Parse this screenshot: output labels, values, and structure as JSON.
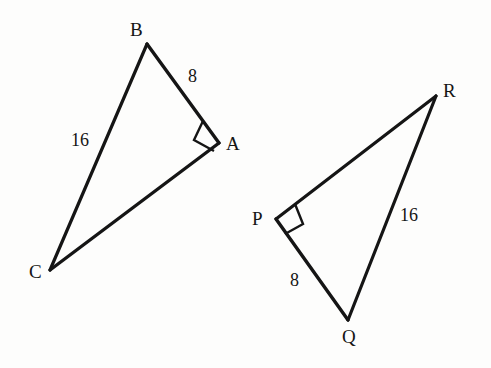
{
  "figure": {
    "background_color": "#fdfdfc",
    "stroke_color": "#151515",
    "stroke_width": 3
  },
  "triangles": [
    {
      "name": "triangle-abc",
      "vertices": [
        {
          "label": "B",
          "x": 147,
          "y": 44
        },
        {
          "label": "A",
          "x": 219,
          "y": 143
        },
        {
          "label": "C",
          "x": 50,
          "y": 270
        }
      ],
      "right_angle_at": "A",
      "sides": [
        {
          "label": "8",
          "from": "B",
          "to": "A"
        },
        {
          "label": "16",
          "from": "B",
          "to": "C"
        },
        {
          "label": "",
          "from": "C",
          "to": "A"
        }
      ]
    },
    {
      "name": "triangle-pqr",
      "vertices": [
        {
          "label": "R",
          "x": 436,
          "y": 96
        },
        {
          "label": "P",
          "x": 276,
          "y": 219
        },
        {
          "label": "Q",
          "x": 348,
          "y": 320
        }
      ],
      "right_angle_at": "P",
      "sides": [
        {
          "label": "8",
          "from": "P",
          "to": "Q"
        },
        {
          "label": "16",
          "from": "Q",
          "to": "R"
        },
        {
          "label": "",
          "from": "P",
          "to": "R"
        }
      ]
    }
  ],
  "labels": {
    "vertex_b": "B",
    "vertex_a": "A",
    "vertex_c": "C",
    "side_ab": "8",
    "side_bc": "16",
    "vertex_r": "R",
    "vertex_p": "P",
    "vertex_q": "Q",
    "side_pq": "8",
    "side_qr": "16"
  }
}
